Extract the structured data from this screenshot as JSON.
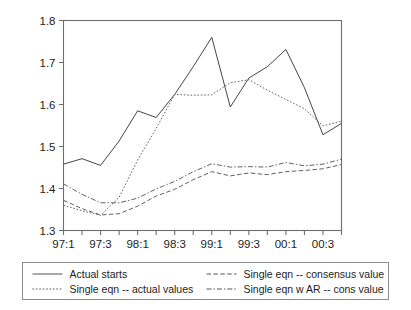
{
  "chart_data": {
    "type": "line",
    "title": "",
    "subtitle": "",
    "xlabel": "",
    "ylabel": "",
    "ylim": [
      1.3,
      1.8
    ],
    "yticks": [
      "1.3",
      "1.4",
      "1.5",
      "1.6",
      "1.7",
      "1.8"
    ],
    "ytick_values": [
      1.3,
      1.4,
      1.5,
      1.6,
      1.7,
      1.8
    ],
    "grid": false,
    "legend_position": "bottom",
    "x": [
      "97:1",
      "97:2",
      "97:3",
      "97:4",
      "98:1",
      "98:2",
      "98:3",
      "98:4",
      "99:1",
      "99:2",
      "99:3",
      "99:4",
      "00:1",
      "00:2",
      "00:3",
      "00:4"
    ],
    "categories": [
      "97:1",
      "97:2",
      "97:3",
      "97:4",
      "98:1",
      "98:2",
      "98:3",
      "98:4",
      "99:1",
      "99:2",
      "99:3",
      "99:4",
      "00:1",
      "00:2",
      "00:3",
      "00:4"
    ],
    "xticks": [
      "97:1",
      "97:3",
      "98:1",
      "98:3",
      "99:1",
      "99:3",
      "00:1",
      "00:3"
    ],
    "xtick_indices": [
      0,
      2,
      4,
      6,
      8,
      10,
      12,
      14
    ],
    "series": [
      {
        "name": "Actual starts",
        "style": "solid",
        "color": "#3c3c3c",
        "values": [
          1.458,
          1.471,
          1.455,
          1.513,
          1.585,
          1.569,
          1.624,
          1.69,
          1.76,
          1.594,
          1.663,
          1.69,
          1.731,
          1.64,
          1.528,
          1.555
        ]
      },
      {
        "name": "Single eqn -- actual values",
        "style": "dotted",
        "color": "#5a5a5a",
        "values": [
          1.36,
          1.347,
          1.336,
          1.379,
          1.468,
          1.543,
          1.624,
          1.622,
          1.623,
          1.652,
          1.659,
          1.634,
          1.612,
          1.59,
          1.549,
          1.56
        ]
      },
      {
        "name": "Single eqn -- consensus value",
        "style": "dashed",
        "color": "#5a5a5a",
        "values": [
          1.372,
          1.352,
          1.337,
          1.34,
          1.358,
          1.382,
          1.398,
          1.421,
          1.44,
          1.43,
          1.437,
          1.433,
          1.44,
          1.443,
          1.447,
          1.457
        ]
      },
      {
        "name": "Single eqn w AR -- cons value",
        "style": "dashdot",
        "color": "#5a5a5a",
        "values": [
          1.411,
          1.386,
          1.366,
          1.366,
          1.377,
          1.399,
          1.417,
          1.44,
          1.459,
          1.451,
          1.452,
          1.451,
          1.462,
          1.454,
          1.458,
          1.47
        ]
      }
    ]
  },
  "legend": {
    "entries": [
      {
        "label": "Actual starts",
        "style": "solid"
      },
      {
        "label": "Single eqn -- consensus value",
        "style": "dashed"
      },
      {
        "label": "Single eqn -- actual values",
        "style": "dotted"
      },
      {
        "label": "Single eqn w AR -- cons value",
        "style": "dashdot"
      }
    ]
  },
  "colors": {
    "axis": "#6e6e6e",
    "text": "#1d1d1d",
    "line": "#4a4a4a",
    "legend_border": "#8c8c8c",
    "background": "#ffffff"
  }
}
